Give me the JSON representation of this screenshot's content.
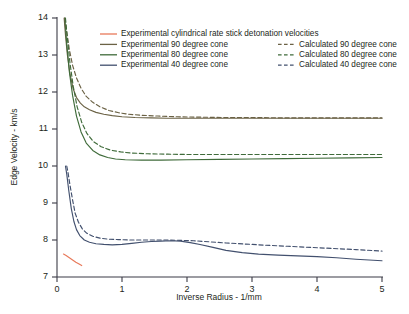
{
  "chart_data": {
    "type": "line",
    "title": "",
    "xlabel": "Inverse Radius - 1/mm",
    "ylabel": "Edge Velocity - km/s",
    "xlim": [
      0,
      5
    ],
    "ylim": [
      7,
      14
    ],
    "xticks": [
      "0",
      "1",
      "2",
      "3",
      "4",
      "5"
    ],
    "yticks": [
      "7",
      "8",
      "9",
      "10",
      "11",
      "12",
      "13",
      "14"
    ],
    "grid": false,
    "legend_position": "upper-center",
    "series": [
      {
        "name": "Experimental cylindrical rate stick detonation velocities",
        "style": "solid",
        "color": "#e8795a",
        "x": [
          0.1,
          0.14,
          0.19,
          0.24,
          0.29,
          0.34,
          0.38
        ],
        "y": [
          7.62,
          7.58,
          7.52,
          7.46,
          7.4,
          7.35,
          7.31
        ]
      },
      {
        "name": "Experimental 90 degree cone",
        "style": "solid",
        "color": "#6b6245",
        "x": [
          0.11,
          0.13,
          0.16,
          0.2,
          0.25,
          0.3,
          0.36,
          0.42,
          0.5,
          0.6,
          0.72,
          0.85,
          1.0,
          1.2,
          1.45,
          1.7,
          2.0,
          2.4,
          2.8,
          3.2,
          3.6,
          4.0,
          4.4,
          4.7,
          5.0
        ],
        "y": [
          14.0,
          13.55,
          13.0,
          12.48,
          12.08,
          11.85,
          11.7,
          11.6,
          11.52,
          11.45,
          11.4,
          11.36,
          11.33,
          11.31,
          11.3,
          11.29,
          11.29,
          11.29,
          11.29,
          11.29,
          11.29,
          11.29,
          11.29,
          11.29,
          11.29
        ]
      },
      {
        "name": "Experimental 80 degree cone",
        "style": "solid",
        "color": "#3f6b3a",
        "x": [
          0.12,
          0.15,
          0.19,
          0.24,
          0.3,
          0.37,
          0.45,
          0.55,
          0.66,
          0.78,
          0.9,
          1.05,
          1.3,
          1.6,
          2.0,
          2.5,
          3.0,
          3.5,
          4.0,
          4.5,
          5.0
        ],
        "y": [
          14.0,
          13.3,
          12.55,
          11.9,
          11.35,
          10.92,
          10.62,
          10.42,
          10.3,
          10.23,
          10.19,
          10.17,
          10.16,
          10.16,
          10.17,
          10.18,
          10.19,
          10.2,
          10.21,
          10.22,
          10.23
        ]
      },
      {
        "name": "Experimental 40 degree cone",
        "style": "solid",
        "color": "#42506e",
        "x": [
          0.13,
          0.15,
          0.18,
          0.22,
          0.26,
          0.3,
          0.35,
          0.42,
          0.5,
          0.6,
          0.72,
          0.85,
          1.0,
          1.15,
          1.3,
          1.45,
          1.6,
          1.75,
          1.9,
          2.05,
          2.2,
          2.4,
          2.6,
          2.85,
          3.1,
          3.4,
          3.7,
          4.0,
          4.3,
          4.6,
          5.0
        ],
        "y": [
          10.0,
          9.78,
          9.35,
          8.85,
          8.5,
          8.28,
          8.12,
          8.0,
          7.94,
          7.9,
          7.88,
          7.87,
          7.88,
          7.91,
          7.94,
          7.96,
          7.97,
          7.98,
          7.97,
          7.93,
          7.88,
          7.8,
          7.72,
          7.66,
          7.62,
          7.59,
          7.57,
          7.55,
          7.52,
          7.48,
          7.44
        ]
      },
      {
        "name": "Calculated 90 degree cone",
        "style": "dashed",
        "color": "#6b6245",
        "x": [
          0.12,
          0.15,
          0.19,
          0.24,
          0.3,
          0.37,
          0.45,
          0.55,
          0.66,
          0.8,
          0.95,
          1.1,
          1.3,
          1.55,
          1.85,
          2.2,
          2.6,
          3.0,
          3.5,
          4.0,
          4.5,
          5.0
        ],
        "y": [
          14.0,
          13.62,
          13.15,
          12.72,
          12.38,
          12.1,
          11.88,
          11.72,
          11.6,
          11.5,
          11.44,
          11.4,
          11.37,
          11.35,
          11.33,
          11.32,
          11.31,
          11.31,
          11.3,
          11.3,
          11.3,
          11.3
        ]
      },
      {
        "name": "Calculated 80 degree cone",
        "style": "dashed",
        "color": "#3f6b3a",
        "x": [
          0.13,
          0.16,
          0.2,
          0.25,
          0.31,
          0.38,
          0.46,
          0.56,
          0.68,
          0.82,
          0.98,
          1.15,
          1.4,
          1.7,
          2.05,
          2.45,
          2.9,
          3.4,
          3.9,
          4.4,
          5.0
        ],
        "y": [
          14.0,
          13.45,
          12.78,
          12.15,
          11.6,
          11.18,
          10.88,
          10.66,
          10.52,
          10.43,
          10.38,
          10.35,
          10.33,
          10.32,
          10.31,
          10.31,
          10.31,
          10.31,
          10.31,
          10.31,
          10.31
        ]
      },
      {
        "name": "Calculated 40 degree cone",
        "style": "dashed",
        "color": "#42506e",
        "x": [
          0.15,
          0.17,
          0.2,
          0.24,
          0.28,
          0.33,
          0.39,
          0.46,
          0.55,
          0.66,
          0.8,
          0.95,
          1.12,
          1.3,
          1.5,
          1.7,
          1.9,
          2.1,
          2.35,
          2.6,
          2.9,
          3.2,
          3.55,
          3.9,
          4.25,
          4.6,
          5.0
        ],
        "y": [
          10.0,
          9.82,
          9.48,
          9.08,
          8.72,
          8.48,
          8.3,
          8.18,
          8.1,
          8.05,
          8.02,
          8.01,
          8.0,
          8.0,
          8.0,
          8.0,
          7.99,
          7.98,
          7.95,
          7.92,
          7.89,
          7.86,
          7.83,
          7.8,
          7.77,
          7.74,
          7.7
        ]
      }
    ]
  },
  "legend": {
    "column_left": [
      {
        "label": "Experimental cylindrical rate stick detonation velocities",
        "color": "#e8795a",
        "style": "solid"
      },
      {
        "label": "Experimental 90 degree cone",
        "color": "#6b6245",
        "style": "solid"
      },
      {
        "label": "Experimental 80 degree cone",
        "color": "#3f6b3a",
        "style": "solid"
      },
      {
        "label": "Experimental 40 degree cone",
        "color": "#42506e",
        "style": "solid"
      }
    ],
    "column_right": [
      {
        "label": "Calculated 90 degree cone",
        "color": "#6b6245",
        "style": "dashed"
      },
      {
        "label": "Calculated 80 degree cone",
        "color": "#3f6b3a",
        "style": "dashed"
      },
      {
        "label": "Calculated 40 degree cone",
        "color": "#42506e",
        "style": "dashed"
      }
    ]
  },
  "colors": {
    "axis": "#3b3b46",
    "text": "#231f20",
    "background": "#ffffff",
    "rate_stick": "#e8795a",
    "cone90": "#6b6245",
    "cone80": "#3f6b3a",
    "cone40": "#42506e"
  }
}
